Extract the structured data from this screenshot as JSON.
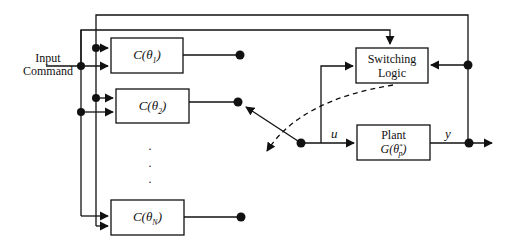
{
  "diagram": {
    "type": "multi-controller switching control block diagram",
    "input_label_line1": "Input",
    "input_label_line2": "Command",
    "controllers": [
      {
        "label": "C(θ",
        "sub": "1",
        "close": ")"
      },
      {
        "label": "C(θ",
        "sub": "2",
        "close": ")"
      },
      {
        "label": "C(θ",
        "sub": "N",
        "close": ")"
      }
    ],
    "ellipsis": "·",
    "switching_logic_line1": "Switching",
    "switching_logic_line2": "Logic",
    "plant_line1": "Plant",
    "plant_line2_prefix": "G(θ",
    "plant_sup": "*",
    "plant_sub": "p",
    "plant_close": ")",
    "signal_u": "u",
    "signal_y": "y",
    "colors": {
      "line": "#111111",
      "background": "#ffffff"
    }
  }
}
